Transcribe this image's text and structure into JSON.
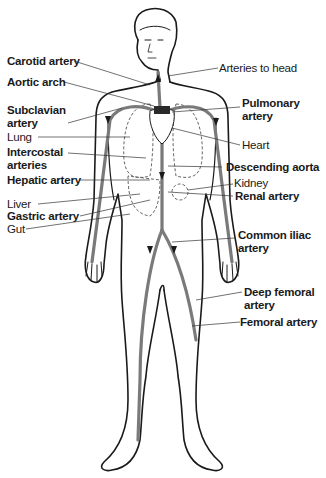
{
  "diagram": {
    "colors": {
      "outline": "#1a1a1a",
      "artery": "#7a7a7a",
      "heart": "#2a2a2a",
      "background": "#ffffff"
    },
    "labels_left": [
      {
        "id": "carotid",
        "line1": "Carotid artery",
        "line2": "",
        "bold": true
      },
      {
        "id": "aortic-arch",
        "line1": "Aortic arch",
        "line2": "",
        "bold": true
      },
      {
        "id": "subclavian",
        "line1": "Subclavian",
        "line2": "artery",
        "bold": true
      },
      {
        "id": "lung",
        "line1": "Lung",
        "line2": "",
        "bold": false
      },
      {
        "id": "intercostal",
        "line1": "Intercostal",
        "line2": "arteries",
        "bold": true
      },
      {
        "id": "hepatic",
        "line1": "Hepatic artery",
        "line2": "",
        "bold": true
      },
      {
        "id": "liver",
        "line1": "Liver",
        "line2": "",
        "bold": false
      },
      {
        "id": "gastric",
        "line1": "Gastric artery",
        "line2": "",
        "bold": true
      },
      {
        "id": "gut",
        "line1": "Gut",
        "line2": "",
        "bold": false
      }
    ],
    "labels_right": [
      {
        "id": "arteries-head",
        "line1": "Arteries to head",
        "line2": "",
        "bold": false
      },
      {
        "id": "pulmonary",
        "line1": "Pulmonary",
        "line2": "artery",
        "bold": true
      },
      {
        "id": "heart",
        "line1": "Heart",
        "line2": "",
        "bold": false
      },
      {
        "id": "descending-aorta",
        "line1": "Descending aorta",
        "line2": "",
        "bold": true
      },
      {
        "id": "kidney",
        "line1": "Kidney",
        "line2": "",
        "bold": false
      },
      {
        "id": "renal",
        "line1": "Renal artery",
        "line2": "",
        "bold": true
      },
      {
        "id": "common-iliac",
        "line1": "Common iliac",
        "line2": "artery",
        "bold": true
      },
      {
        "id": "deep-femoral",
        "line1": "Deep femoral",
        "line2": "artery",
        "bold": true
      },
      {
        "id": "femoral",
        "line1": "Femoral artery",
        "line2": "",
        "bold": true
      }
    ]
  }
}
